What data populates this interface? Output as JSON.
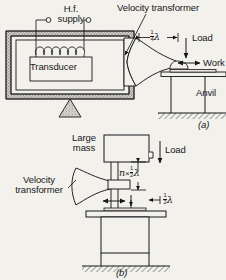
{
  "figure": {
    "background_color": "#f3f1ec",
    "ink_color": "#17171a"
  },
  "labels": {
    "hf_supply_line1": "H.f.",
    "hf_supply_line2": "supply",
    "transducer": "Transducer",
    "velocity_transformer_top": "Velocity transformer",
    "velocity_transformer_b_line1": "Velocity",
    "velocity_transformer_b_line2": "transformer",
    "load_a": "Load",
    "load_b": "Load",
    "work": "Work",
    "anvil": "Anvil",
    "large_mass_line1": "Large",
    "large_mass_line2": "mass"
  },
  "dimensions": {
    "quarter_lambda": {
      "num": "1",
      "den": "4",
      "symbol": "λ"
    },
    "half_lambda": {
      "num": "1",
      "den": "2",
      "symbol": "λ"
    },
    "n_half_lambda": {
      "n": "n",
      "times": "×",
      "num": "1",
      "den": "2",
      "symbol": "λ"
    }
  },
  "captions": {
    "a": "(a)",
    "b": "(b)"
  },
  "icons": {
    "terminal_left": "terminal-circle",
    "terminal_right": "terminal-circle",
    "ground_hatch": "ground-hatching",
    "pivot": "triangle-pivot",
    "coil": "induction-coil"
  }
}
